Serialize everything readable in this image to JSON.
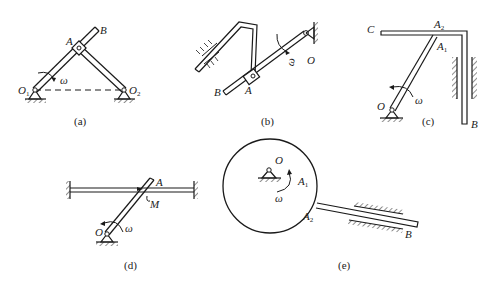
{
  "figure": {
    "panels": [
      {
        "id": "a",
        "caption": "(a)",
        "labels": {
          "A": "A",
          "B": "B",
          "O1": "O",
          "O1_sub": "1",
          "O2": "O",
          "O2_sub": "2",
          "omega": "ω"
        }
      },
      {
        "id": "b",
        "caption": "(b)",
        "labels": {
          "A": "A",
          "B": "B",
          "O": "O",
          "omega": "ω"
        }
      },
      {
        "id": "c",
        "caption": "(c)",
        "labels": {
          "C": "C",
          "A2": "A",
          "A2_sub": "2",
          "A1": "A",
          "A1_sub": "1",
          "O": "O",
          "B": "B",
          "omega": "ω"
        }
      },
      {
        "id": "d",
        "caption": "(d)",
        "labels": {
          "A": "A",
          "M": "M",
          "O": "O",
          "omega": "ω"
        }
      },
      {
        "id": "e",
        "caption": "(e)",
        "labels": {
          "O": "O",
          "A1": "A",
          "A1_sub": "1",
          "A2": "A",
          "A2_sub": "2",
          "B": "B",
          "omega": "ω"
        }
      }
    ]
  }
}
